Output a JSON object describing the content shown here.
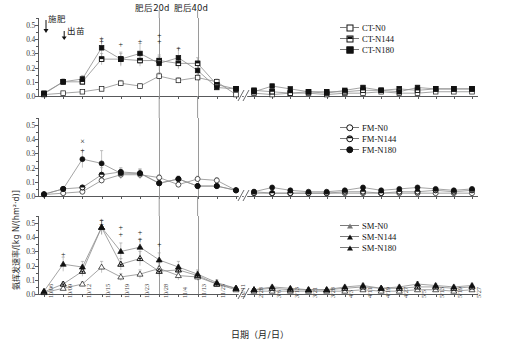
{
  "axis": {
    "y_label": "氨挥发速率/[kg N/(hm²·d)]",
    "x_title": "日期（月/日）",
    "y_ticks": [
      "0.0",
      "0.1",
      "0.2",
      "0.3",
      "0.4",
      "0.5"
    ]
  },
  "annotations": [
    {
      "name": "fertilization",
      "text": "施肥"
    },
    {
      "name": "emergence",
      "text": "出苗"
    },
    {
      "name": "day20-after-fertilization",
      "text": "肥后20d"
    },
    {
      "name": "day40-after-fertilization",
      "text": "肥后40d"
    }
  ],
  "legends": {
    "panel1": [
      "CT-N0",
      "CT-N144",
      "CT-N180"
    ],
    "panel2": [
      "FM-N0",
      "FM-N144",
      "FM-N180"
    ],
    "panel3": [
      "SM-N0",
      "SM-N144",
      "SM-N180"
    ]
  },
  "chart_data": {
    "type": "line",
    "title": "",
    "xlabel": "日期（月/日）",
    "ylabel": "氨挥发速率/[kg N/(hm²·d)]",
    "ylim": [
      0.0,
      0.55
    ],
    "ytick_values": [
      0.0,
      0.1,
      0.2,
      0.3,
      0.4,
      0.5
    ],
    "grid": false,
    "legend_position": "top-right of each panel",
    "axis_break_between": [
      "12/11",
      "2/28"
    ],
    "categories": [
      "10/06",
      "10/09",
      "10/12",
      "10/15",
      "10/19",
      "10/23",
      "10/28",
      "11/4",
      "11/13",
      "11/25",
      "12/11",
      "2/28",
      "3/6",
      "3/13",
      "3/21",
      "3/28",
      "4/3",
      "4/11",
      "4/19",
      "4/27",
      "5/5",
      "5/13",
      "5/19",
      "5/27"
    ],
    "panels": [
      {
        "name": "CT",
        "marker": "square",
        "series": [
          {
            "name": "CT-N0",
            "fill": "open",
            "values": [
              0.01,
              0.02,
              0.03,
              0.05,
              0.09,
              0.07,
              0.14,
              0.11,
              0.13,
              0.1,
              0.01,
              0.02,
              0.01,
              0.02,
              0.02,
              0.01,
              0.02,
              0.02,
              0.03,
              0.02,
              0.02,
              0.03,
              0.03,
              0.03
            ],
            "err": [
              0.005,
              0.008,
              0.01,
              0.012,
              0.02,
              0.015,
              0.025,
              0.02,
              0.02,
              0.02,
              0.004,
              0.005,
              0.004,
              0.005,
              0.005,
              0.004,
              0.005,
              0.005,
              0.006,
              0.005,
              0.005,
              0.006,
              0.006,
              0.006
            ]
          },
          {
            "name": "CT-N144",
            "fill": "half",
            "values": [
              0.015,
              0.1,
              0.1,
              0.26,
              0.26,
              0.25,
              0.25,
              0.23,
              0.23,
              0.08,
              0.05,
              0.04,
              0.03,
              0.02,
              0.03,
              0.03,
              0.03,
              0.04,
              0.04,
              0.05,
              0.04,
              0.05,
              0.05,
              0.05
            ],
            "err": [
              0.006,
              0.02,
              0.02,
              0.04,
              0.04,
              0.04,
              0.04,
              0.04,
              0.04,
              0.02,
              0.01,
              0.01,
              0.008,
              0.006,
              0.008,
              0.008,
              0.008,
              0.01,
              0.01,
              0.012,
              0.01,
              0.012,
              0.012,
              0.012
            ]
          },
          {
            "name": "CT-N180",
            "fill": "filled",
            "values": [
              0.02,
              0.1,
              0.12,
              0.34,
              0.26,
              0.3,
              0.23,
              0.27,
              0.18,
              0.06,
              0.05,
              0.03,
              0.07,
              0.05,
              0.03,
              0.02,
              0.04,
              0.06,
              0.04,
              0.03,
              0.06,
              0.05,
              0.05,
              0.05
            ],
            "err": [
              0.007,
              0.02,
              0.025,
              0.06,
              0.05,
              0.07,
              0.05,
              0.07,
              0.04,
              0.015,
              0.012,
              0.008,
              0.015,
              0.012,
              0.008,
              0.006,
              0.01,
              0.015,
              0.01,
              0.008,
              0.015,
              0.012,
              0.012,
              0.012
            ]
          }
        ],
        "significance": [
          {
            "x": "10/15",
            "y": 0.41,
            "mark": "+"
          },
          {
            "x": "10/15",
            "y": 0.385,
            "mark": "+"
          },
          {
            "x": "10/19",
            "y": 0.37,
            "mark": "+"
          },
          {
            "x": "10/23",
            "y": 0.39,
            "mark": "+"
          },
          {
            "x": "10/28",
            "y": 0.43,
            "mark": "+"
          },
          {
            "x": "10/28",
            "y": 0.385,
            "mark": "+"
          },
          {
            "x": "11/4",
            "y": 0.34,
            "mark": "+"
          }
        ]
      },
      {
        "name": "FM",
        "marker": "circle",
        "series": [
          {
            "name": "FM-N0",
            "fill": "open",
            "values": [
              0.01,
              0.02,
              0.03,
              0.11,
              0.15,
              0.15,
              0.13,
              0.08,
              0.12,
              0.11,
              0.04,
              0.03,
              0.02,
              0.02,
              0.02,
              0.02,
              0.02,
              0.02,
              0.02,
              0.02,
              0.02,
              0.02,
              0.02,
              0.02
            ],
            "err": [
              0.004,
              0.006,
              0.008,
              0.02,
              0.03,
              0.03,
              0.02,
              0.015,
              0.02,
              0.02,
              0.01,
              0.008,
              0.005,
              0.005,
              0.005,
              0.005,
              0.005,
              0.005,
              0.005,
              0.005,
              0.005,
              0.005,
              0.005,
              0.005
            ]
          },
          {
            "name": "FM-N144",
            "fill": "half",
            "values": [
              0.012,
              0.05,
              0.06,
              0.15,
              0.17,
              0.16,
              0.09,
              0.12,
              0.07,
              0.07,
              0.04,
              0.02,
              0.02,
              0.02,
              0.02,
              0.02,
              0.03,
              0.03,
              0.02,
              0.03,
              0.03,
              0.04,
              0.03,
              0.04
            ],
            "err": [
              0.005,
              0.012,
              0.012,
              0.05,
              0.03,
              0.03,
              0.02,
              0.02,
              0.015,
              0.015,
              0.01,
              0.006,
              0.006,
              0.006,
              0.006,
              0.006,
              0.008,
              0.008,
              0.006,
              0.008,
              0.008,
              0.01,
              0.008,
              0.01
            ]
          },
          {
            "name": "FM-N180",
            "fill": "filled",
            "values": [
              0.013,
              0.05,
              0.26,
              0.23,
              0.16,
              0.16,
              0.09,
              0.12,
              0.07,
              0.07,
              0.04,
              0.03,
              0.06,
              0.04,
              0.03,
              0.03,
              0.04,
              0.06,
              0.04,
              0.05,
              0.06,
              0.05,
              0.04,
              0.05
            ],
            "err": [
              0.005,
              0.012,
              0.06,
              0.09,
              0.03,
              0.03,
              0.02,
              0.02,
              0.015,
              0.015,
              0.01,
              0.008,
              0.015,
              0.01,
              0.008,
              0.008,
              0.01,
              0.015,
              0.01,
              0.012,
              0.015,
              0.012,
              0.01,
              0.012
            ]
          }
        ],
        "significance": [
          {
            "x": "10/12",
            "y": 0.39,
            "mark": "×"
          },
          {
            "x": "10/12",
            "y": 0.325,
            "mark": "+"
          }
        ]
      },
      {
        "name": "SM",
        "marker": "triangle",
        "series": [
          {
            "name": "SM-N0",
            "fill": "open",
            "values": [
              0.01,
              0.04,
              0.07,
              0.19,
              0.12,
              0.14,
              0.18,
              0.13,
              0.12,
              0.07,
              0.03,
              0.02,
              0.02,
              0.02,
              0.02,
              0.02,
              0.02,
              0.03,
              0.02,
              0.02,
              0.03,
              0.03,
              0.02,
              0.03
            ],
            "err": [
              0.004,
              0.01,
              0.015,
              0.04,
              0.025,
              0.03,
              0.04,
              0.03,
              0.025,
              0.015,
              0.008,
              0.005,
              0.005,
              0.005,
              0.005,
              0.005,
              0.005,
              0.008,
              0.005,
              0.005,
              0.008,
              0.008,
              0.005,
              0.008
            ]
          },
          {
            "name": "SM-N144",
            "fill": "half",
            "values": [
              0.015,
              0.07,
              0.16,
              0.47,
              0.21,
              0.25,
              0.16,
              0.17,
              0.13,
              0.07,
              0.04,
              0.03,
              0.04,
              0.03,
              0.03,
              0.03,
              0.04,
              0.05,
              0.04,
              0.04,
              0.05,
              0.05,
              0.04,
              0.05
            ],
            "err": [
              0.006,
              0.015,
              0.035,
              0.05,
              0.04,
              0.05,
              0.035,
              0.035,
              0.03,
              0.015,
              0.01,
              0.008,
              0.01,
              0.008,
              0.008,
              0.008,
              0.01,
              0.012,
              0.01,
              0.01,
              0.012,
              0.012,
              0.01,
              0.012
            ]
          },
          {
            "name": "SM-N180",
            "fill": "filled",
            "values": [
              0.02,
              0.21,
              0.19,
              0.47,
              0.3,
              0.33,
              0.24,
              0.19,
              0.14,
              0.08,
              0.04,
              0.03,
              0.05,
              0.04,
              0.03,
              0.03,
              0.05,
              0.06,
              0.04,
              0.05,
              0.07,
              0.06,
              0.05,
              0.06
            ],
            "err": [
              0.007,
              0.05,
              0.04,
              0.05,
              0.06,
              0.06,
              0.05,
              0.04,
              0.03,
              0.02,
              0.01,
              0.008,
              0.012,
              0.01,
              0.008,
              0.008,
              0.012,
              0.015,
              0.01,
              0.012,
              0.018,
              0.015,
              0.012,
              0.015
            ]
          }
        ],
        "significance": [
          {
            "x": "10/09",
            "y": 0.285,
            "mark": "+"
          },
          {
            "x": "10/15",
            "y": 0.525,
            "mark": "+"
          },
          {
            "x": "10/15",
            "y": 0.495,
            "mark": "+"
          },
          {
            "x": "10/19",
            "y": 0.475,
            "mark": "+"
          },
          {
            "x": "10/19",
            "y": 0.425,
            "mark": "+"
          },
          {
            "x": "10/23",
            "y": 0.435,
            "mark": "+"
          },
          {
            "x": "10/23",
            "y": 0.385,
            "mark": "+"
          },
          {
            "x": "10/28",
            "y": 0.355,
            "mark": "+"
          }
        ]
      }
    ]
  }
}
